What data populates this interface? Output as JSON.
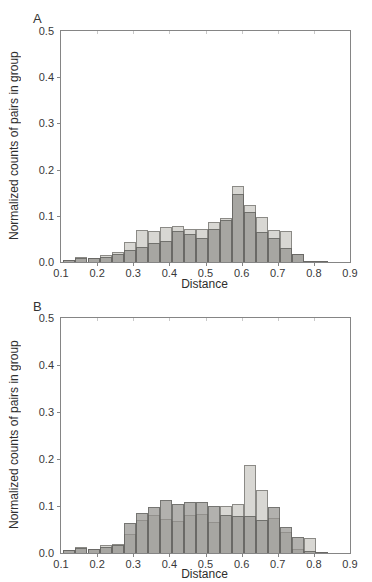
{
  "figure": {
    "background": "#ffffff",
    "colors": {
      "light_fill": "#d8d7d3",
      "light_edge": "#8b8a86",
      "dark_fill": "rgba(148,147,143,0.72)",
      "dark_edge": "rgba(85,85,82,0.65)",
      "axis": "#858585",
      "text": "#2e2e2e"
    }
  },
  "chart_data": [
    {
      "type": "bar",
      "subtype": "overlaid-histogram",
      "panel_label": "A",
      "title": "",
      "xlabel": "Distance",
      "ylabel": "Normalized counts of pairs in group",
      "xlim": [
        0.1,
        0.9
      ],
      "ylim": [
        0,
        0.5
      ],
      "xticks": [
        "0.1",
        "0.2",
        "0.3",
        "0.4",
        "0.5",
        "0.6",
        "0.7",
        "0.8",
        "0.9"
      ],
      "yticks": [
        "0.0",
        "0.1",
        "0.2",
        "0.3",
        "0.4",
        "0.5"
      ],
      "grid": false,
      "legend": "none",
      "bin_start": 0.1067,
      "bin_width": 0.03333,
      "series": [
        {
          "name": "light-gray-group",
          "values": [
            0.004,
            0.011,
            0.009,
            0.016,
            0.021,
            0.043,
            0.07,
            0.067,
            0.075,
            0.079,
            0.072,
            0.071,
            0.086,
            0.096,
            0.165,
            0.123,
            0.098,
            0.07,
            0.067,
            0.017,
            0.002,
            0.001,
            0.0
          ]
        },
        {
          "name": "dark-gray-group",
          "values": [
            0.004,
            0.009,
            0.009,
            0.011,
            0.017,
            0.026,
            0.032,
            0.042,
            0.045,
            0.067,
            0.06,
            0.053,
            0.071,
            0.091,
            0.148,
            0.109,
            0.066,
            0.052,
            0.031,
            0.017,
            0.002,
            0.001,
            0.0
          ]
        }
      ]
    },
    {
      "type": "bar",
      "subtype": "overlaid-histogram",
      "panel_label": "B",
      "title": "",
      "xlabel": "Distance",
      "ylabel": "Normalized counts of pairs in group",
      "xlim": [
        0.1,
        0.9
      ],
      "ylim": [
        0,
        0.5
      ],
      "xticks": [
        "0.1",
        "0.2",
        "0.3",
        "0.4",
        "0.5",
        "0.6",
        "0.7",
        "0.8",
        "0.9"
      ],
      "yticks": [
        "0.0",
        "0.1",
        "0.2",
        "0.3",
        "0.4",
        "0.5"
      ],
      "grid": false,
      "legend": "none",
      "bin_start": 0.1067,
      "bin_width": 0.03333,
      "series": [
        {
          "name": "light-gray-group",
          "values": [
            0.006,
            0.013,
            0.009,
            0.018,
            0.02,
            0.041,
            0.07,
            0.081,
            0.072,
            0.069,
            0.081,
            0.084,
            0.065,
            0.1,
            0.104,
            0.188,
            0.135,
            0.075,
            0.045,
            0.008,
            0.033,
            0.002,
            0.0
          ]
        },
        {
          "name": "dark-gray-group",
          "values": [
            0.006,
            0.011,
            0.009,
            0.013,
            0.016,
            0.063,
            0.086,
            0.097,
            0.112,
            0.104,
            0.109,
            0.108,
            0.099,
            0.08,
            0.078,
            0.079,
            0.07,
            0.098,
            0.056,
            0.034,
            0.004,
            0.002,
            0.0
          ]
        }
      ]
    }
  ]
}
